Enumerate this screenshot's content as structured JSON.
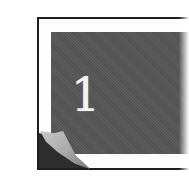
{
  "icon": {
    "type": "page-curl-chapter-icon",
    "numeral": "1",
    "colors": {
      "frame_border": "#1e1e1e",
      "panel": "#555555",
      "numeral": "#f2f2f2",
      "curl": "#b0b0b0",
      "background": "#ffffff"
    }
  }
}
